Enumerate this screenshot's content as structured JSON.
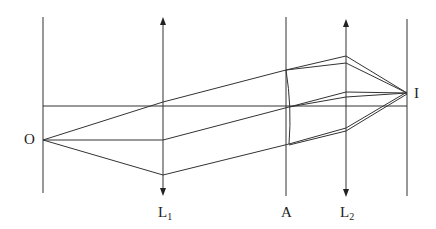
{
  "diagram": {
    "colors": {
      "line": "#333333",
      "background": "#ffffff"
    },
    "labels": {
      "object": "O",
      "image": "I",
      "lens1": "L",
      "lens1_sub": "1",
      "aperture": "A",
      "lens2": "L",
      "lens2_sub": "2"
    },
    "planes": [
      {
        "name": "object-plane",
        "x": 43,
        "y1": 17,
        "y2": 193
      },
      {
        "name": "aperture-plane",
        "x": 286,
        "y1": 17,
        "y2": 196
      },
      {
        "name": "image-plane",
        "x": 407,
        "y1": 19,
        "y2": 196
      }
    ],
    "lenses": [
      {
        "name": "lens-L1",
        "x": 163,
        "y1": 17,
        "y2": 195
      },
      {
        "name": "lens-L2",
        "x": 346,
        "y1": 19,
        "y2": 196
      }
    ],
    "axis": {
      "x1": 43,
      "x2": 407,
      "y": 106
    }
  }
}
